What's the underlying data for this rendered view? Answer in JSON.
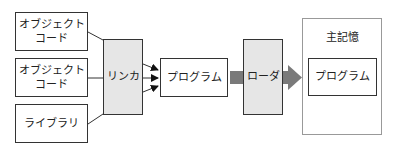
{
  "diagram": {
    "inputs": [
      {
        "label": "オブジェクト\nコード"
      },
      {
        "label": "オブジェクト\nコード"
      },
      {
        "label": "ライブラリ"
      }
    ],
    "linker": {
      "label": "リンカ"
    },
    "program": {
      "label": "プログラム"
    },
    "loader": {
      "label": "ローダ"
    },
    "memory": {
      "title": "主記憶",
      "program": {
        "label": "プログラム"
      }
    },
    "colors": {
      "border": "#333333",
      "shaded_fill": "#e6e6e6",
      "thick_arrow": "#7a7a7a",
      "memory_border": "#999999"
    }
  }
}
